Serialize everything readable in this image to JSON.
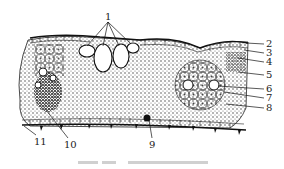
{
  "figure": {
    "type": "leaf-cross-section",
    "labels": [
      {
        "id": "1",
        "text": "1",
        "x": 105,
        "y": 12
      },
      {
        "id": "2",
        "text": "2",
        "x": 266,
        "y": 39
      },
      {
        "id": "3",
        "text": "3",
        "x": 266,
        "y": 48
      },
      {
        "id": "4",
        "text": "4",
        "x": 266,
        "y": 57
      },
      {
        "id": "5",
        "text": "5",
        "x": 266,
        "y": 70
      },
      {
        "id": "6",
        "text": "6",
        "x": 266,
        "y": 84
      },
      {
        "id": "7",
        "text": "7",
        "x": 266,
        "y": 93
      },
      {
        "id": "8",
        "text": "8",
        "x": 266,
        "y": 103
      },
      {
        "id": "9",
        "text": "9",
        "x": 149,
        "y": 140
      },
      {
        "id": "10",
        "text": "10",
        "x": 64,
        "y": 140
      },
      {
        "id": "11",
        "text": "11",
        "x": 34,
        "y": 137
      }
    ],
    "caption": ""
  }
}
